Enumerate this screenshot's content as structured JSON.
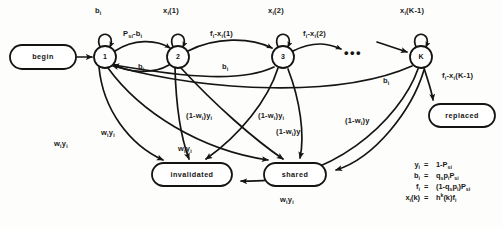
{
  "figure": {
    "type": "markov-chain-state-diagram",
    "title": "",
    "width": 503,
    "height": 228,
    "ink_color": "#141412",
    "background": "#fdfdfb"
  },
  "nodes": {
    "states": [
      {
        "id": "state-1",
        "label": "1",
        "cx": 105,
        "cy": 57,
        "r": 11
      },
      {
        "id": "state-2",
        "label": "2",
        "cx": 178,
        "cy": 57,
        "r": 11
      },
      {
        "id": "state-3",
        "label": "3",
        "cx": 283,
        "cy": 57,
        "r": 11
      },
      {
        "id": "state-K",
        "label": "K",
        "cx": 421,
        "cy": 57,
        "r": 11
      }
    ],
    "terminals": [
      {
        "id": "begin-node",
        "label": "begin",
        "x": 10,
        "y": 45,
        "w": 66,
        "h": 24
      },
      {
        "id": "replaced-node",
        "label": "replaced",
        "x": 429,
        "y": 104,
        "w": 66,
        "h": 23
      },
      {
        "id": "invalidated-node",
        "label": "invalidated",
        "x": 152,
        "y": 163,
        "w": 80,
        "h": 23
      },
      {
        "id": "shared-node",
        "label": "shared",
        "x": 264,
        "y": 163,
        "w": 62,
        "h": 23
      }
    ],
    "ellipsis": {
      "id": "chain-ellipsis",
      "label": "•••",
      "x": 344,
      "y": 46
    }
  },
  "edge_labels": {
    "self_loops": [
      {
        "id": "loop-1",
        "text_html": "b<sub>i</sub>",
        "x": 95,
        "y": 7
      },
      {
        "id": "loop-2",
        "text_html": "x<sub>i</sub>(1)",
        "x": 163,
        "y": 7
      },
      {
        "id": "loop-3",
        "text_html": "x<sub>i</sub>(2)",
        "x": 268,
        "y": 7
      },
      {
        "id": "loop-K",
        "text_html": "x<sub>i</sub>(K-1)",
        "x": 400,
        "y": 7
      }
    ],
    "forward": [
      {
        "id": "fwd-1-2",
        "text_html": "P<sub>si</sub>-b<sub>i</sub>",
        "x": 123,
        "y": 30
      },
      {
        "id": "fwd-2-3",
        "text_html": "f<sub>i</sub>-x<sub>i</sub>(1)",
        "x": 210,
        "y": 30
      },
      {
        "id": "fwd-3-4",
        "text_html": "f<sub>i</sub>-x<sub>i</sub>(2)",
        "x": 303,
        "y": 30
      },
      {
        "id": "fwd-K-replaced",
        "text_html": "f<sub>i</sub>-x<sub>i</sub>(K-1)",
        "x": 442,
        "y": 72
      }
    ],
    "backward": [
      {
        "id": "bwd-2-1",
        "text_html": "b<sub>i</sub>",
        "x": 138,
        "y": 63
      },
      {
        "id": "bwd-3-1",
        "text_html": "b<sub>i</sub>",
        "x": 222,
        "y": 63
      },
      {
        "id": "bwd-K-1",
        "text_html": "b<sub>i</sub>",
        "x": 383,
        "y": 77
      }
    ],
    "to_invalidated": [
      {
        "id": "inv-lbl-1",
        "text_html": "w<sub>i</sub>y<sub>i</sub>",
        "x": 54,
        "y": 140
      },
      {
        "id": "inv-lbl-2",
        "text_html": "w<sub>i</sub>y<sub>i</sub>",
        "x": 101,
        "y": 129
      },
      {
        "id": "inv-lbl-3",
        "text_html": "w<sub>i</sub>y<sub>i</sub>",
        "x": 178,
        "y": 145
      },
      {
        "id": "inv-lbl-4",
        "text_html": "w<sub>i</sub>y<sub>i</sub>",
        "x": 280,
        "y": 196
      }
    ],
    "to_shared": [
      {
        "id": "shr-lbl-1",
        "text_html": "(1-w<sub>i</sub>)y<sub>i</sub>",
        "x": 186,
        "y": 112
      },
      {
        "id": "shr-lbl-2",
        "text_html": "(1-w<sub>i</sub>)y<sub>i</sub>",
        "x": 258,
        "y": 112
      },
      {
        "id": "shr-lbl-3",
        "text_html": "(1-w<sub>i</sub>)y",
        "x": 276,
        "y": 128
      },
      {
        "id": "shr-lbl-4",
        "text_html": "(1-w<sub>i</sub>)y",
        "x": 345,
        "y": 117
      }
    ]
  },
  "equations": [
    {
      "id": "eq-y",
      "lhs_html": "y<sub>i</sub>",
      "rel": "=",
      "rhs_html": "1-P<sub>si</sub>"
    },
    {
      "id": "eq-b",
      "lhs_html": "b<sub>i</sub>",
      "rel": "=",
      "rhs_html": "q<sub>s</sub>p<sub>i</sub>P<sub>si</sub>"
    },
    {
      "id": "eq-f",
      "lhs_html": "f<sub>i</sub>",
      "rel": "=",
      "rhs_html": "(1-q<sub>s</sub>p<sub>i</sub>)P<sub>si</sub>"
    },
    {
      "id": "eq-x",
      "lhs_html": "x<sub>i</sub>(k)",
      "rel": "=",
      "rhs_html": "h<sup>k</sup>(k)f<sub>i</sub>"
    }
  ]
}
